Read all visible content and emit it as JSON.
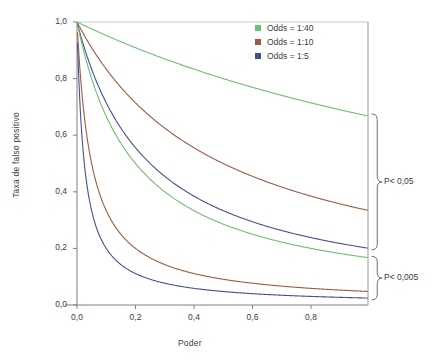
{
  "chart_data": {
    "type": "line",
    "title": "",
    "xlabel": "Poder",
    "ylabel": "Taxa de falso positivo",
    "xlim": [
      -0.04,
      1.0
    ],
    "ylim": [
      0.0,
      1.0
    ],
    "xticks": [
      "0,0",
      "0,2",
      "0,4",
      "0,6",
      "0,8"
    ],
    "xtick_values": [
      0.0,
      0.2,
      0.4,
      0.6,
      0.8
    ],
    "yticks": [
      "0,0",
      "0,2",
      "0,4",
      "0,6",
      "0,8",
      "1,0"
    ],
    "ytick_values": [
      0.0,
      0.2,
      0.4,
      0.6,
      0.8,
      1.0
    ],
    "grid": false,
    "legend_position": "top-right",
    "x": [
      0.01,
      0.02,
      0.03,
      0.05,
      0.08,
      0.1,
      0.15,
      0.2,
      0.25,
      0.3,
      0.35,
      0.4,
      0.45,
      0.5,
      0.55,
      0.6,
      0.65,
      0.7,
      0.75,
      0.8,
      0.85,
      0.9,
      0.95,
      0.99
    ],
    "series": [
      {
        "name": "Odds = 1:40, P< 0,05",
        "group": "P< 0,05",
        "odds": 0.025,
        "alpha": 0.05,
        "color": "#6fbf6f",
        "values": [
          0.995,
          0.99,
          0.985,
          0.976,
          0.962,
          0.952,
          0.93,
          0.909,
          0.889,
          0.87,
          0.851,
          0.833,
          0.816,
          0.8,
          0.784,
          0.769,
          0.755,
          0.741,
          0.727,
          0.714,
          0.702,
          0.69,
          0.678,
          0.669
        ]
      },
      {
        "name": "Odds = 1:10, P< 0,05",
        "group": "P< 0,05",
        "odds": 0.1,
        "alpha": 0.05,
        "color": "#9d5b42",
        "values": [
          0.98,
          0.962,
          0.943,
          0.909,
          0.862,
          0.833,
          0.769,
          0.714,
          0.667,
          0.625,
          0.588,
          0.556,
          0.526,
          0.5,
          0.476,
          0.455,
          0.435,
          0.417,
          0.4,
          0.385,
          0.37,
          0.357,
          0.345,
          0.336
        ]
      },
      {
        "name": "Odds = 1:5, P< 0,05",
        "group": "P< 0,05",
        "odds": 0.2,
        "alpha": 0.05,
        "color": "#46518f",
        "values": [
          0.962,
          0.926,
          0.893,
          0.833,
          0.758,
          0.714,
          0.625,
          0.556,
          0.5,
          0.455,
          0.417,
          0.385,
          0.357,
          0.333,
          0.313,
          0.294,
          0.278,
          0.263,
          0.25,
          0.238,
          0.227,
          0.217,
          0.208,
          0.202
        ]
      },
      {
        "name": "Odds = 1:40, P< 0,005",
        "group": "P< 0,005",
        "odds": 0.025,
        "alpha": 0.005,
        "color": "#6fbf6f",
        "values": [
          0.952,
          0.909,
          0.87,
          0.8,
          0.714,
          0.667,
          0.571,
          0.5,
          0.444,
          0.4,
          0.364,
          0.333,
          0.308,
          0.286,
          0.267,
          0.25,
          0.235,
          0.222,
          0.211,
          0.2,
          0.19,
          0.182,
          0.174,
          0.168
        ]
      },
      {
        "name": "Odds = 1:10, P< 0,005",
        "group": "P< 0,005",
        "odds": 0.1,
        "alpha": 0.005,
        "color": "#9d5b42",
        "values": [
          0.833,
          0.714,
          0.625,
          0.5,
          0.385,
          0.333,
          0.25,
          0.2,
          0.167,
          0.143,
          0.125,
          0.111,
          0.1,
          0.091,
          0.083,
          0.077,
          0.071,
          0.067,
          0.063,
          0.059,
          0.056,
          0.053,
          0.05,
          0.048
        ]
      },
      {
        "name": "Odds = 1:5, P< 0,005",
        "group": "P< 0,005",
        "odds": 0.2,
        "alpha": 0.005,
        "color": "#46518f",
        "values": [
          0.714,
          0.556,
          0.455,
          0.333,
          0.238,
          0.2,
          0.143,
          0.111,
          0.091,
          0.077,
          0.067,
          0.059,
          0.053,
          0.048,
          0.043,
          0.04,
          0.037,
          0.034,
          0.032,
          0.03,
          0.029,
          0.027,
          0.026,
          0.025
        ]
      }
    ],
    "legend": [
      {
        "label": "Odds = 1:40",
        "color": "#6fbf6f"
      },
      {
        "label": "Odds = 1:10",
        "color": "#9d5b42"
      },
      {
        "label": "Odds = 1:5",
        "color": "#46518f"
      }
    ],
    "annotations": [
      {
        "label": "P< 0,05",
        "brace_top": 0.675,
        "brace_bottom": 0.195
      },
      {
        "label": "P< 0,005",
        "brace_top": 0.172,
        "brace_bottom": 0.018
      }
    ]
  }
}
